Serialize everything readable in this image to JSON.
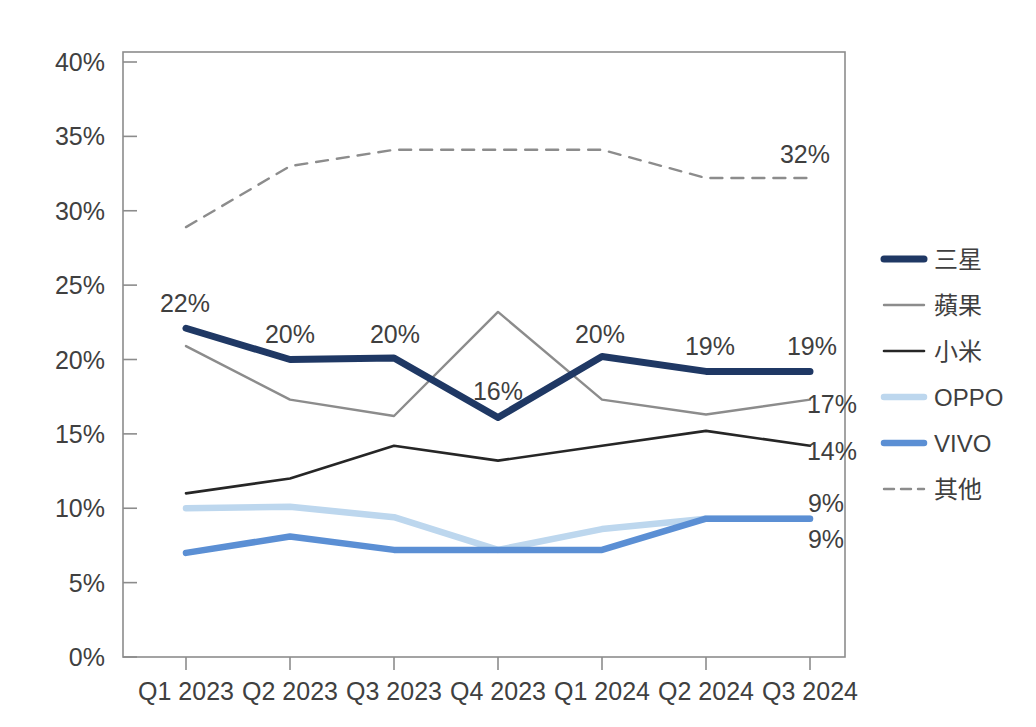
{
  "chart_data": {
    "type": "line",
    "title": "",
    "subtitle": "",
    "xlabel": "",
    "ylabel": "",
    "categories": [
      "Q1 2023",
      "Q2 2023",
      "Q3 2023",
      "Q4 2023",
      "Q1 2024",
      "Q2 2024",
      "Q3 2024"
    ],
    "ylim": [
      0,
      40
    ],
    "ytick_labels": [
      "0%",
      "5%",
      "10%",
      "15%",
      "20%",
      "25%",
      "30%",
      "35%",
      "40%"
    ],
    "ytick_values": [
      0,
      5,
      10,
      15,
      20,
      25,
      30,
      35,
      40
    ],
    "grid": false,
    "legend_position": "right",
    "value_suffix": "%",
    "series": [
      {
        "name": "三星",
        "color": "#1F3864",
        "width": 7,
        "dash": "none",
        "values": [
          22.1,
          20.0,
          20.1,
          16.1,
          20.2,
          19.2,
          19.2
        ],
        "end_label": "",
        "point_labels": [
          "22%",
          "20%",
          "20%",
          "16%",
          "20%",
          "19%",
          "19%"
        ]
      },
      {
        "name": "蘋果",
        "color": "#8C8C8C",
        "width": 2.4,
        "dash": "none",
        "values": [
          20.9,
          17.3,
          16.2,
          23.2,
          17.3,
          16.3,
          17.3
        ],
        "end_label": "17%",
        "point_labels": [
          "",
          "",
          "",
          "",
          "",
          "",
          ""
        ]
      },
      {
        "name": "小米",
        "color": "#262626",
        "width": 2.6,
        "dash": "none",
        "values": [
          11.0,
          12.0,
          14.2,
          13.2,
          14.2,
          15.2,
          14.2
        ],
        "end_label": "14%",
        "point_labels": [
          "",
          "",
          "",
          "",
          "",
          "",
          ""
        ]
      },
      {
        "name": "OPPO",
        "color": "#BDD7EE",
        "width": 6.5,
        "dash": "none",
        "values": [
          10.0,
          10.1,
          9.4,
          7.2,
          8.6,
          9.3,
          9.3
        ],
        "end_label": "9%",
        "point_labels": [
          "",
          "",
          "",
          "",
          "",
          "",
          ""
        ]
      },
      {
        "name": "VIVO",
        "color": "#5B8FD4",
        "width": 6.5,
        "dash": "none",
        "values": [
          7.0,
          8.1,
          7.2,
          7.2,
          7.2,
          9.3,
          9.3
        ],
        "end_label": "9%",
        "point_labels": [
          "",
          "",
          "",
          "",
          "",
          "",
          ""
        ]
      },
      {
        "name": "其他",
        "color": "#8C8C8C",
        "width": 2.4,
        "dash": "12 9",
        "values": [
          28.9,
          33.0,
          34.1,
          34.1,
          34.1,
          32.2,
          32.2
        ],
        "end_label": "32%",
        "point_labels": [
          "",
          "",
          "",
          "",
          "",
          "",
          ""
        ]
      }
    ],
    "callout_labels": [
      {
        "text": "22%",
        "x": 185,
        "y": 312
      },
      {
        "text": "20%",
        "x": 290,
        "y": 343
      },
      {
        "text": "20%",
        "x": 395,
        "y": 343
      },
      {
        "text": "16%",
        "x": 498,
        "y": 400
      },
      {
        "text": "20%",
        "x": 600,
        "y": 343
      },
      {
        "text": "19%",
        "x": 710,
        "y": 355
      },
      {
        "text": "19%",
        "x": 812,
        "y": 355
      },
      {
        "text": "32%",
        "x": 805,
        "y": 163
      },
      {
        "text": "17%",
        "x": 832,
        "y": 413
      },
      {
        "text": "14%",
        "x": 832,
        "y": 460
      },
      {
        "text": "9%",
        "x": 826,
        "y": 512
      },
      {
        "text": "9%",
        "x": 826,
        "y": 548
      }
    ]
  },
  "legend": {
    "items": [
      {
        "label": "三星",
        "color": "#1F3864",
        "width": 7,
        "dash": "none"
      },
      {
        "label": "蘋果",
        "color": "#8C8C8C",
        "width": 2.4,
        "dash": "none"
      },
      {
        "label": "小米",
        "color": "#262626",
        "width": 2.6,
        "dash": "none"
      },
      {
        "label": "OPPO",
        "color": "#BDD7EE",
        "width": 6.5,
        "dash": "none"
      },
      {
        "label": "VIVO",
        "color": "#5B8FD4",
        "width": 6.5,
        "dash": "none"
      },
      {
        "label": "其他",
        "color": "#8C8C8C",
        "width": 2.4,
        "dash": "10 7"
      }
    ]
  },
  "axes": {
    "y_labels": [
      "40%",
      "35%",
      "30%",
      "25%",
      "20%",
      "15%",
      "10%",
      "5%",
      "0%"
    ],
    "x_labels": [
      "Q1 2023",
      "Q2 2023",
      "Q3 2023",
      "Q4 2023",
      "Q1 2024",
      "Q2 2024",
      "Q3 2024"
    ]
  }
}
